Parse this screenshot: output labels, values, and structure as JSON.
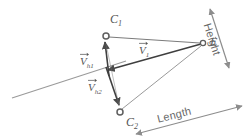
{
  "figure": {
    "background_color": "#ffffff",
    "line_color": "#6e6e6e",
    "label_color": "#555555",
    "width": 248,
    "height": 140
  },
  "points": [
    {
      "id": "C1",
      "label_base": "C",
      "label_sub": "1",
      "x": 106,
      "y": 36,
      "marker": "open-circle"
    },
    {
      "id": "C2",
      "label_base": "C",
      "label_sub": "2",
      "x": 120,
      "y": 112,
      "marker": "open-circle"
    },
    {
      "id": "E",
      "label_base": "E",
      "label_sub": "",
      "x": 203,
      "y": 43,
      "marker": "open-circle"
    }
  ],
  "vectors": [
    {
      "id": "V1",
      "label_base": "V",
      "label_sub": "1",
      "has_overarrow": true,
      "from_x": 203,
      "from_y": 43,
      "to_x": 105,
      "to_y": 71,
      "label_x": 139,
      "label_y": 48
    },
    {
      "id": "Vh1",
      "label_base": "V",
      "label_sub": "h1",
      "has_overarrow": true,
      "from_x": 108,
      "from_y": 75,
      "to_x": 104,
      "to_y": 40,
      "label_x": 80,
      "label_y": 56
    },
    {
      "id": "Vh2",
      "label_base": "V",
      "label_sub": "h2",
      "has_overarrow": true,
      "from_x": 105,
      "from_y": 68,
      "to_x": 120,
      "to_y": 107,
      "label_x": 88,
      "label_y": 82
    }
  ],
  "dimensions": [
    {
      "id": "height",
      "label": "Height",
      "label_x": 217,
      "label_y": 18,
      "rotation_deg": 68,
      "arrow_from_x": 228,
      "arrow_from_y": 67,
      "arrow_to_x": 210,
      "arrow_to_y": 9,
      "double_headed": true
    },
    {
      "id": "length",
      "label": "Length",
      "label_x": 160,
      "label_y": 107,
      "rotation_deg": -14,
      "arrow_from_x": 136,
      "arrow_from_y": 134,
      "arrow_to_x": 241,
      "arrow_to_y": 106,
      "double_headed": true
    }
  ],
  "lines": [
    {
      "id": "epipolar-plane-line",
      "from_x": 12,
      "from_y": 98,
      "to_x": 126,
      "to_y": 61
    },
    {
      "id": "C1-to-E",
      "from_x": 108,
      "from_y": 37,
      "to_x": 201,
      "to_y": 43
    },
    {
      "id": "C2-to-E",
      "from_x": 122,
      "from_y": 110,
      "to_x": 202,
      "to_y": 46
    },
    {
      "id": "C1-to-C2-baseline",
      "from_x": 106,
      "from_y": 39,
      "to_x": 120,
      "to_y": 109
    }
  ]
}
